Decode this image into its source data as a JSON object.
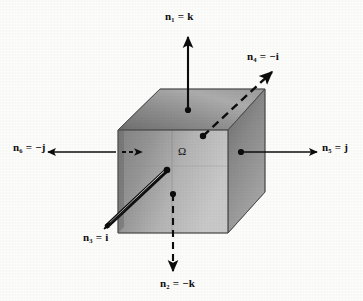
{
  "figure": {
    "region_label": "Ω",
    "colors": {
      "background": "#fdfdfb",
      "ink": "#0d0d0d",
      "cube_top_light": "#b9b9b9",
      "cube_top_dark": "#7c7c7c",
      "cube_front_light": "#c9c9c9",
      "cube_front_dark": "#6e6e6e",
      "cube_side_light": "#d2d2d2",
      "cube_side_dark": "#808080"
    },
    "normals": [
      {
        "id": "n1",
        "symbol": "n",
        "subscript": "1",
        "equals": "=",
        "value": "k",
        "text": "n₁ = k",
        "direction": "up",
        "face": "top",
        "arrow_style": "solid"
      },
      {
        "id": "n2",
        "symbol": "n",
        "subscript": "2",
        "equals": "=",
        "value": "−k",
        "text": "n₂ = −k",
        "direction": "down",
        "face": "bottom",
        "arrow_style": "dashed"
      },
      {
        "id": "n3",
        "symbol": "n",
        "subscript": "3",
        "equals": "=",
        "value": "i",
        "text": "n₃ = i",
        "direction": "down-left",
        "face": "front",
        "arrow_style": "outline"
      },
      {
        "id": "n4",
        "symbol": "n",
        "subscript": "4",
        "equals": "=",
        "value": "−i",
        "text": "n₄ = −i",
        "direction": "up-right",
        "face": "back",
        "arrow_style": "dashed"
      },
      {
        "id": "n5",
        "symbol": "n",
        "subscript": "5",
        "equals": "=",
        "value": "j",
        "text": "n₅ = j",
        "direction": "right",
        "face": "right",
        "arrow_style": "solid"
      },
      {
        "id": "n6",
        "symbol": "n",
        "subscript": "6",
        "equals": "=",
        "value": "−j",
        "text": "n₆ = −j",
        "direction": "left",
        "face": "left",
        "arrow_style": "solid"
      }
    ]
  }
}
